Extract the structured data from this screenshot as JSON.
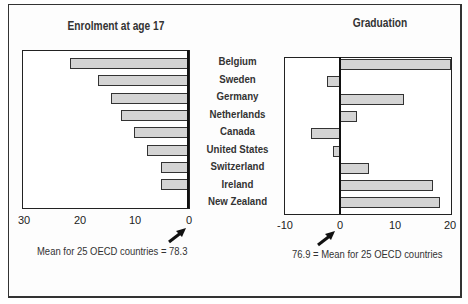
{
  "chart_data": [
    {
      "type": "bar",
      "orientation": "horizontal",
      "title": "Enrolment at age 17",
      "categories": [
        "Belgium",
        "Sweden",
        "Germany",
        "Netherlands",
        "Canada",
        "United States",
        "Switzerland",
        "Ireland",
        "New Zealand"
      ],
      "values": [
        21.5,
        16.4,
        14.0,
        12.2,
        9.8,
        7.5,
        4.9,
        4.9,
        0
      ],
      "xlim": [
        30,
        0
      ],
      "xticks": [
        "30",
        "20",
        "10",
        "0"
      ],
      "annotation": "Mean for 25 OECD countries = 78.3",
      "xlabel": "",
      "ylabel": ""
    },
    {
      "type": "bar",
      "orientation": "horizontal",
      "title": "Graduation",
      "categories": [
        "Belgium",
        "Sweden",
        "Germany",
        "Netherlands",
        "Canada",
        "United States",
        "Switzerland",
        "Ireland",
        "New Zealand"
      ],
      "values": [
        20.2,
        -2.4,
        11.6,
        3.1,
        -5.3,
        -1.2,
        5.3,
        16.9,
        18.2
      ],
      "xlim": [
        -10,
        20
      ],
      "xticks": [
        "-10",
        "0",
        "10",
        "20"
      ],
      "annotation": "76.9 = Mean for 25 OECD countries",
      "xlabel": "",
      "ylabel": ""
    }
  ],
  "left": {
    "title": "Enrolment at age 17",
    "ticks": [
      "30",
      "20",
      "10",
      "0"
    ],
    "note": "Mean for 25 OECD countries = 78.3"
  },
  "right": {
    "title": "Graduation",
    "ticks": [
      "-10",
      "0",
      "10",
      "20"
    ],
    "note": "76.9 = Mean for 25 OECD countries"
  },
  "categories": [
    "Belgium",
    "Sweden",
    "Germany",
    "Netherlands",
    "Canada",
    "United States",
    "Switzerland",
    "Ireland",
    "New Zealand"
  ],
  "colors": {
    "bar_fill": "#d4d4d4",
    "bar_border": "#333333",
    "axis": "#111111"
  }
}
